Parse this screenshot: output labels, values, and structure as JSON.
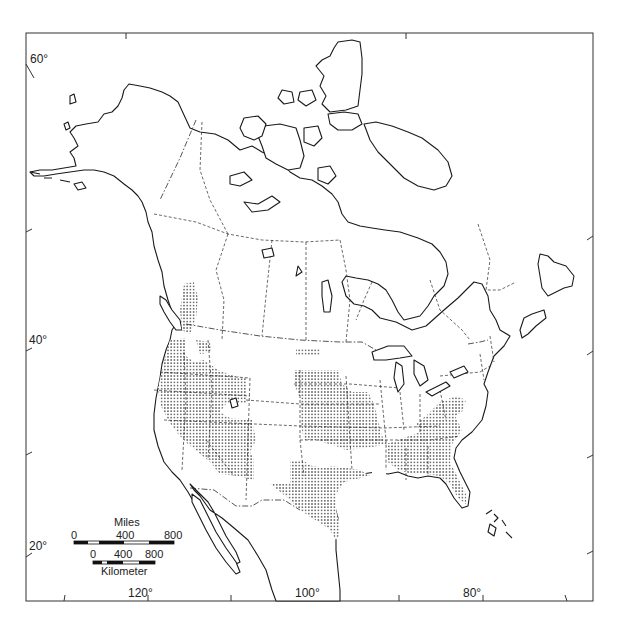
{
  "map": {
    "type": "species-range-map",
    "region": "North America",
    "range_pattern": "stippled dots",
    "colors": {
      "ink": "#1a1a1a",
      "background": "#ffffff",
      "stipple": "#333333"
    }
  },
  "latitude_labels": [
    {
      "label": "60°"
    },
    {
      "label": "40°"
    },
    {
      "label": "20°"
    }
  ],
  "longitude_labels": [
    {
      "label": "120°"
    },
    {
      "label": "100°"
    },
    {
      "label": "80°"
    }
  ],
  "scale_bar": {
    "miles": {
      "title": "Miles",
      "ticks": [
        "0",
        "400",
        "800"
      ]
    },
    "kilometers": {
      "title": "Kilometer",
      "ticks": [
        "0",
        "400",
        "800"
      ]
    }
  }
}
